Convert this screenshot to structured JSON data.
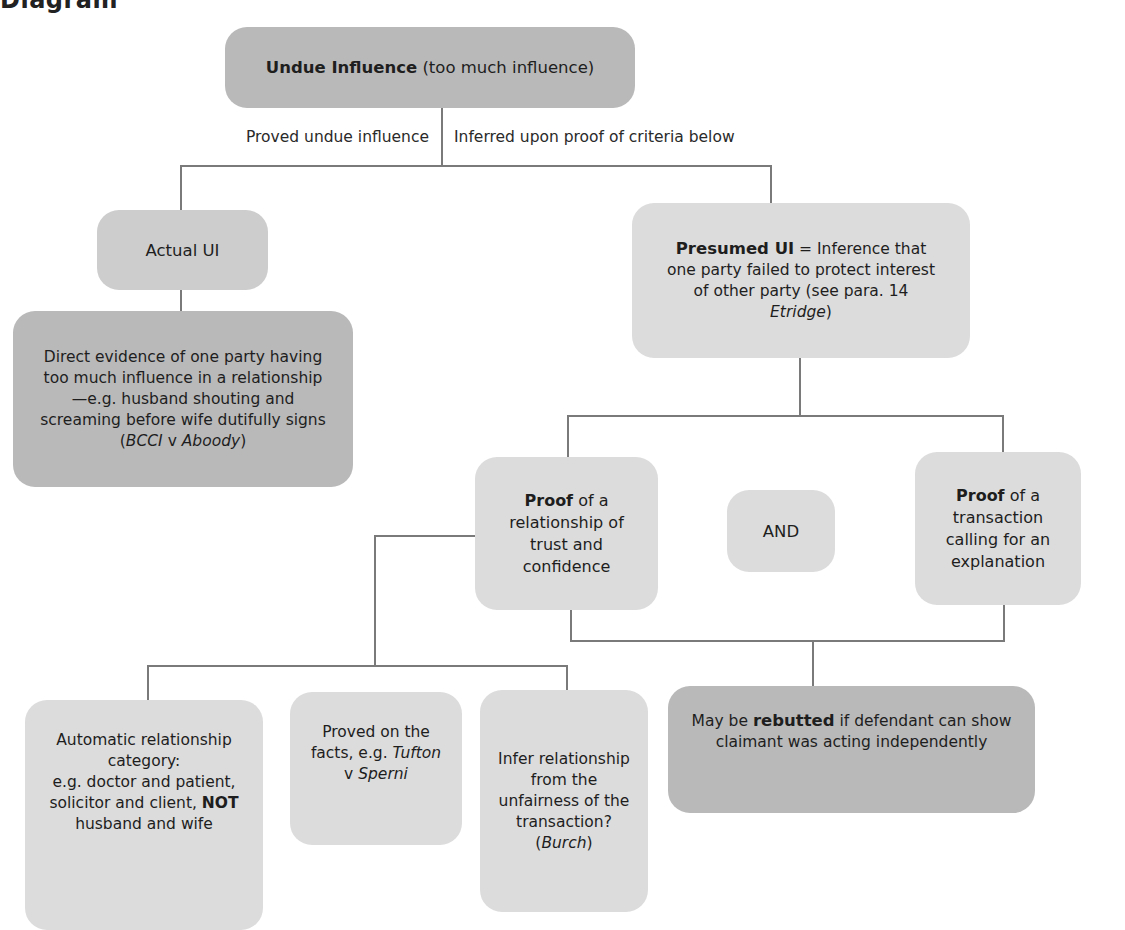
{
  "heading": "Diagram",
  "colors": {
    "dark_box": "#b9b9b9",
    "mid_box": "#cdcdcd",
    "light_box": "#dcdcdc",
    "connector": "#7a7a7a"
  },
  "root": {
    "bold": "Undue Influence",
    "rest": " (too much influence)"
  },
  "branch_labels": {
    "left": "Proved undue influence",
    "right": "Inferred upon proof of criteria below"
  },
  "actual": {
    "title": "Actual UI"
  },
  "direct_evidence": {
    "text": "Direct evidence of one party having too much influence in a relationship—e.g. husband shouting and screaming before wife dutifully signs (",
    "case1": "BCCI",
    "v": " v ",
    "case2": "Aboody",
    "close": ")"
  },
  "presumed": {
    "bold": "Presumed UI",
    "text": " = Inference that one party failed to protect interest of other party (see para. 14 ",
    "case": "Etridge",
    "close": ")"
  },
  "proof_relationship": {
    "bold": "Proof",
    "text": " of a relationship of trust and confidence"
  },
  "and_label": "AND",
  "proof_transaction": {
    "bold": "Proof",
    "text": " of a transaction calling for an explanation"
  },
  "automatic": {
    "line1": "Automatic relationship category:",
    "line2": "e.g. doctor and patient, solicitor and client, ",
    "bold": "NOT",
    "line3": " husband and wife"
  },
  "proved_on_facts": {
    "text": "Proved on the facts, e.g. ",
    "case1": "Tufton",
    "v": " v ",
    "case2": "Sperni"
  },
  "infer": {
    "text": "Infer relationship from the unfairness of the transaction? (",
    "case": "Burch",
    "close": ")"
  },
  "rebutted": {
    "pre": "May be ",
    "bold": "rebutted",
    "post": " if defendant can show claimant was acting independently"
  }
}
